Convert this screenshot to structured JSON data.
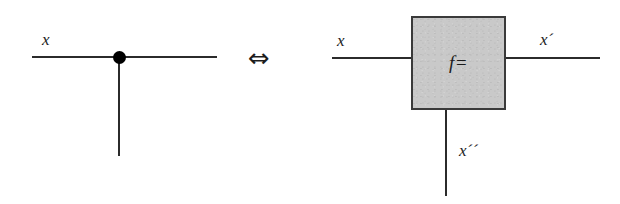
{
  "figure": {
    "caption": "",
    "equivalence_symbol": "⇔",
    "colors": {
      "wire": "#2b2b2b",
      "node": "#000000",
      "box_fill": "#c9c9c9",
      "box_border": "#3a3a3a",
      "text": "#1c1c1c",
      "background": "#ffffff"
    }
  },
  "left_diagram": {
    "name": "branch-node",
    "labels": {
      "input": "x"
    },
    "node": {
      "type": "junction-dot"
    }
  },
  "right_diagram": {
    "name": "function-block",
    "box": {
      "label": "f=",
      "fill": "#c9c9c9"
    },
    "labels": {
      "input": "x",
      "output_right": "x´",
      "output_bottom": "x´´"
    }
  }
}
